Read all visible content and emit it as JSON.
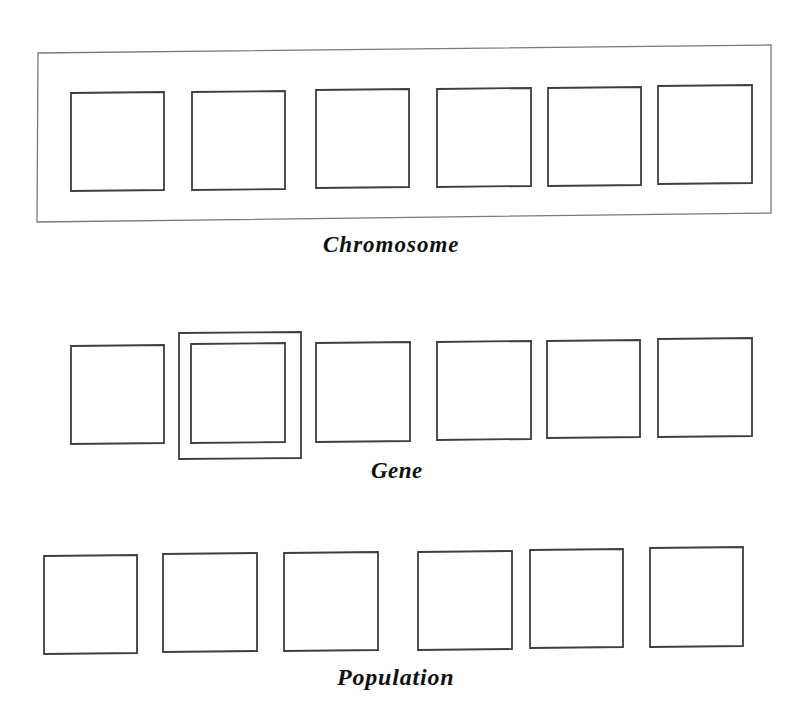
{
  "colors": {
    "background": "#ffffff",
    "box_stroke": "#3f3f3f",
    "frame_stroke": "#7a7a7a",
    "label_text": "#111111"
  },
  "diagram": {
    "chromosome": {
      "label": "Chromosome",
      "frame": {
        "points": [
          [
            38,
            53
          ],
          [
            771,
            45
          ],
          [
            771,
            213
          ],
          [
            37,
            222
          ]
        ]
      },
      "boxes": [
        {
          "x1": 71,
          "y1": 93,
          "x2": 164,
          "y2": 191
        },
        {
          "x1": 192,
          "y1": 92,
          "x2": 285,
          "y2": 190
        },
        {
          "x1": 316,
          "y1": 90,
          "x2": 409,
          "y2": 188
        },
        {
          "x1": 437,
          "y1": 89,
          "x2": 531,
          "y2": 187
        },
        {
          "x1": 548,
          "y1": 88,
          "x2": 641,
          "y2": 186
        },
        {
          "x1": 658,
          "y1": 86,
          "x2": 752,
          "y2": 184
        }
      ]
    },
    "gene": {
      "label": "Gene",
      "highlight": {
        "x1": 179,
        "y1": 333,
        "x2": 301,
        "y2": 459,
        "target_index": 1
      },
      "boxes": [
        {
          "x1": 71,
          "y1": 346,
          "x2": 164,
          "y2": 444
        },
        {
          "x1": 191,
          "y1": 344,
          "x2": 285,
          "y2": 443
        },
        {
          "x1": 316,
          "y1": 343,
          "x2": 410,
          "y2": 442
        },
        {
          "x1": 437,
          "y1": 342,
          "x2": 531,
          "y2": 440
        },
        {
          "x1": 547,
          "y1": 341,
          "x2": 640,
          "y2": 438
        },
        {
          "x1": 658,
          "y1": 339,
          "x2": 752,
          "y2": 437
        }
      ]
    },
    "population": {
      "label": "Population",
      "boxes": [
        {
          "x1": 44,
          "y1": 556,
          "x2": 137,
          "y2": 654
        },
        {
          "x1": 163,
          "y1": 554,
          "x2": 257,
          "y2": 652
        },
        {
          "x1": 284,
          "y1": 553,
          "x2": 378,
          "y2": 651
        },
        {
          "x1": 418,
          "y1": 552,
          "x2": 512,
          "y2": 650
        },
        {
          "x1": 530,
          "y1": 550,
          "x2": 623,
          "y2": 648
        },
        {
          "x1": 650,
          "y1": 548,
          "x2": 743,
          "y2": 647
        }
      ]
    }
  }
}
